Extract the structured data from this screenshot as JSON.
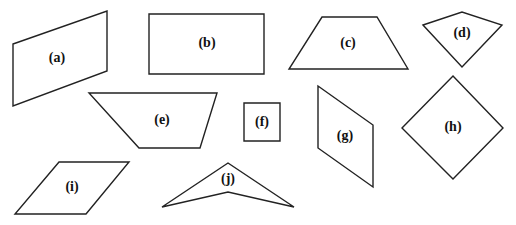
{
  "figure": {
    "shapes": [
      {
        "id": "a",
        "label": "(a)",
        "kind": "parallelogram",
        "points": "13,44 107,11 107,71 13,106",
        "label_pos": [
          57,
          59
        ]
      },
      {
        "id": "b",
        "label": "(b)",
        "kind": "rectangle",
        "points": "149,14 264,14 264,74 149,74",
        "label_pos": [
          207,
          44
        ]
      },
      {
        "id": "c",
        "label": "(c)",
        "kind": "trapezoid",
        "points": "322,17 377,17 408,69 289,69",
        "label_pos": [
          348,
          44
        ]
      },
      {
        "id": "d",
        "label": "(d)",
        "kind": "kite",
        "points": "423,25 462,12 502,25 462,67",
        "label_pos": [
          462,
          34
        ]
      },
      {
        "id": "e",
        "label": "(e)",
        "kind": "trapezoid",
        "points": "89,93 217,93 200,148 139,148",
        "label_pos": [
          162,
          121
        ]
      },
      {
        "id": "f",
        "label": "(f)",
        "kind": "square",
        "points": "244,103 280,103 280,141 244,141",
        "label_pos": [
          262,
          123
        ]
      },
      {
        "id": "g",
        "label": "(g)",
        "kind": "parallelogram",
        "points": "318,86 373,125 373,187 318,148",
        "label_pos": [
          345,
          137
        ]
      },
      {
        "id": "h",
        "label": "(h)",
        "kind": "rhombus",
        "points": "453,76 503,128 453,179 402,128",
        "label_pos": [
          453,
          128
        ]
      },
      {
        "id": "i",
        "label": "(i)",
        "kind": "parallelogram",
        "points": "59,162 129,162 86,214 15,214",
        "label_pos": [
          72,
          188
        ]
      },
      {
        "id": "j",
        "label": "(j)",
        "kind": "dart",
        "points": "228,163 294,207 228,192 162,207",
        "label_pos": [
          228,
          180
        ]
      }
    ]
  }
}
